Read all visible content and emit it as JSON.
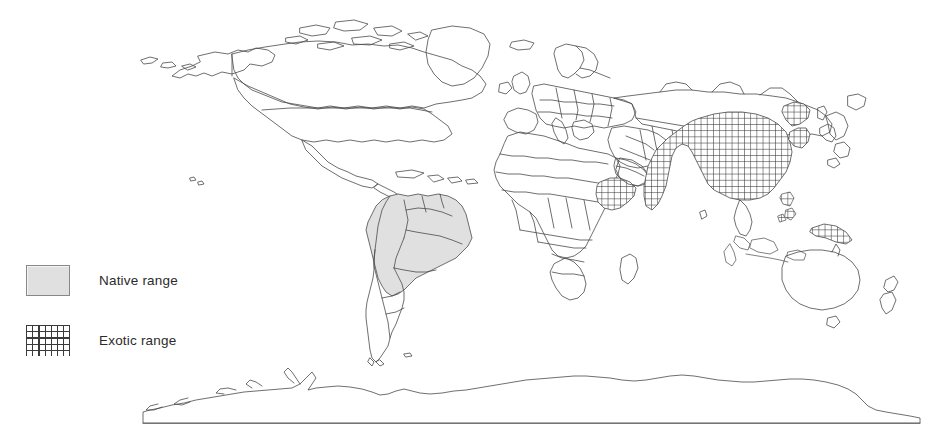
{
  "figure": {
    "background_color": "#ffffff",
    "outline_color": "#4a4a4a"
  },
  "legend": {
    "items": [
      {
        "key": "native",
        "label": "Native range",
        "swatch_type": "solid-fill",
        "fill_color": "#e0e0e0",
        "border_color": "#888888"
      },
      {
        "key": "exotic",
        "label": "Exotic range",
        "swatch_type": "crosshatch",
        "hatch_color": "#3a3a3a",
        "fill_color": "#ffffff"
      }
    ]
  },
  "map_regions": {
    "native_range": {
      "label": "Native range",
      "fill": "#e0e0e0",
      "areas": [
        "Northern South America",
        "Amazon basin",
        "Brazil",
        "Colombia",
        "Venezuela",
        "Peru",
        "Bolivia",
        "Guianas"
      ]
    },
    "exotic_range": {
      "label": "Exotic range",
      "fill": "crosshatch",
      "areas": [
        "China",
        "India",
        "Southeast Asia",
        "Korea",
        "Ethiopia / East Africa",
        "Indonesia",
        "Philippines",
        "New Guinea"
      ]
    },
    "unshaded": {
      "label": "Not present",
      "fill": "#ffffff",
      "areas": [
        "North America",
        "Europe",
        "North Africa",
        "Southern Africa",
        "Australia",
        "New Zealand",
        "Antarctica",
        "Russia",
        "Middle East"
      ]
    }
  }
}
